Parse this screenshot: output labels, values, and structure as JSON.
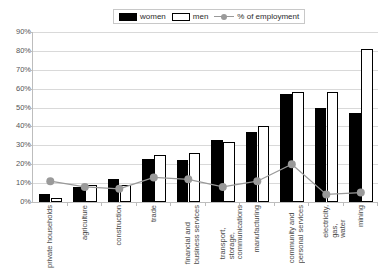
{
  "legend": {
    "items": [
      {
        "label": "women",
        "swatch": "black-filled-square-icon"
      },
      {
        "label": "men",
        "swatch": "white-outlined-square-icon"
      },
      {
        "label": "% of employment",
        "swatch": "gray-line-marker-icon"
      }
    ]
  },
  "axis": {
    "y_ticks": [
      "0%",
      "10%",
      "20%",
      "30%",
      "40%",
      "50%",
      "60%",
      "70%",
      "80%",
      "90%"
    ]
  },
  "colors": {
    "women": "#000000",
    "men": "#ffffff",
    "men_border": "#000000",
    "line": "#999999",
    "marker": "#9a9a9a",
    "grid": "#d9d9d9",
    "axis": "#bdbdbd",
    "text": "#4a4a4a",
    "background": "#ffffff"
  },
  "chart_data": {
    "type": "bar",
    "title": "",
    "xlabel": "",
    "ylabel": "",
    "ylim": [
      0,
      90
    ],
    "ytick_step": 10,
    "grid": true,
    "legend_position": "top-center",
    "categories": [
      "private households",
      "agriculture",
      "construction",
      "trade",
      "financial and business services",
      "transport, storage, communications",
      "manufacturing",
      "community and personal services",
      "electricity, gas, water",
      "mining"
    ],
    "series": [
      {
        "name": "women",
        "type": "bar",
        "values": [
          4,
          8,
          12,
          23,
          22,
          33,
          37,
          57,
          50,
          47
        ]
      },
      {
        "name": "men",
        "type": "bar",
        "values": [
          2,
          9,
          9,
          25,
          26,
          32,
          40,
          58,
          58,
          81
        ]
      },
      {
        "name": "% of employment",
        "type": "line",
        "values": [
          11,
          8,
          7,
          13,
          12,
          8,
          11,
          20,
          4,
          5
        ]
      }
    ]
  }
}
